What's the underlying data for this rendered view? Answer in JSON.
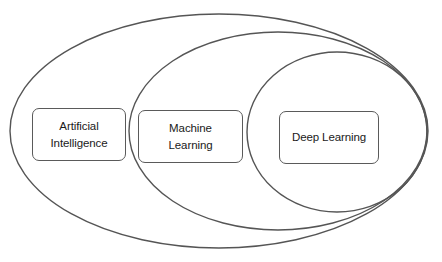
{
  "diagram": {
    "type": "nested-ellipses",
    "stroke_color": "#555555",
    "background_color": "#ffffff",
    "sets": [
      {
        "id": "ai",
        "label": "Artificial\nIntelligence",
        "ellipse": {
          "cx": 219,
          "cy": 131,
          "rx": 209,
          "ry": 117
        }
      },
      {
        "id": "ml",
        "label": "Machine\nLearning",
        "ellipse": {
          "cx": 278,
          "cy": 131,
          "rx": 149,
          "ry": 99
        }
      },
      {
        "id": "dl",
        "label": "Deep Learning",
        "ellipse": {
          "cx": 337,
          "cy": 132,
          "rx": 90,
          "ry": 80
        }
      }
    ],
    "relationship": "Deep Learning ⊂ Machine Learning ⊂ Artificial Intelligence"
  }
}
